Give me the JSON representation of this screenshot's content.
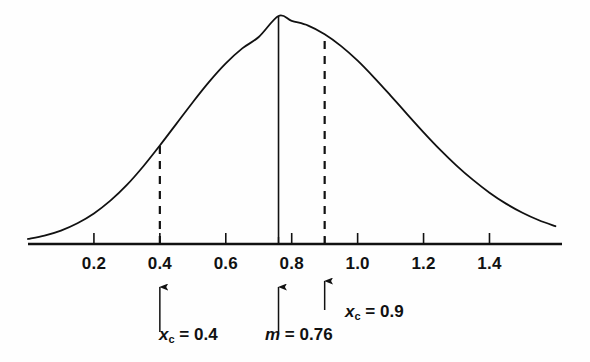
{
  "chart_data": {
    "type": "line",
    "title": "",
    "subtitle": "",
    "xlabel": "",
    "ylabel": "",
    "xlim": [
      0.0,
      1.62
    ],
    "ylim": [
      0.0,
      1.05
    ],
    "grid": false,
    "legend": false,
    "curve": {
      "name": "Gaussian distribution",
      "distribution": "normal",
      "mean": 0.76,
      "sigma": 0.31,
      "peak_value": 1.0
    },
    "x_tick_values": [
      0.2,
      0.4,
      0.6,
      0.8,
      1.0,
      1.2,
      1.4
    ],
    "x_tick_labels": [
      "0.2",
      "0.4",
      "0.6",
      "0.8",
      "1.0",
      "1.2",
      "1.4"
    ],
    "extra_ticks": [
      0.76,
      0.9
    ],
    "vertical_lines": [
      {
        "id": "xc-low",
        "x": 0.4,
        "style": "dashed",
        "label_text": "0.4"
      },
      {
        "id": "mean",
        "x": 0.76,
        "style": "solid",
        "label_text": "0.76"
      },
      {
        "id": "xc-high",
        "x": 0.9,
        "style": "dashed",
        "label_text": "0.9"
      }
    ],
    "annotations": [
      {
        "id": "ann-xc-low",
        "x": 0.4,
        "symbol": "x",
        "subscript": "c",
        "equals": "=",
        "value": "0.4"
      },
      {
        "id": "ann-mean",
        "x": 0.76,
        "symbol": "m",
        "subscript": "",
        "equals": "=",
        "value": "0.76"
      },
      {
        "id": "ann-xc-high",
        "x": 0.9,
        "symbol": "x",
        "subscript": "c",
        "equals": "=",
        "value": "0.9"
      }
    ],
    "series": [
      {
        "name": "Gaussian distribution",
        "x": [
          0.0,
          0.05,
          0.1,
          0.15,
          0.2,
          0.25,
          0.3,
          0.35,
          0.4,
          0.45,
          0.5,
          0.55,
          0.6,
          0.65,
          0.7,
          0.76,
          0.8,
          0.85,
          0.9,
          0.95,
          1.0,
          1.05,
          1.1,
          1.15,
          1.2,
          1.25,
          1.3,
          1.35,
          1.4,
          1.45,
          1.5,
          1.55,
          1.6
        ],
        "y": [
          0.022,
          0.037,
          0.059,
          0.091,
          0.134,
          0.19,
          0.259,
          0.341,
          0.432,
          0.527,
          0.622,
          0.712,
          0.792,
          0.858,
          0.908,
          1.0,
          0.979,
          0.958,
          0.92,
          0.868,
          0.804,
          0.73,
          0.651,
          0.57,
          0.49,
          0.414,
          0.344,
          0.281,
          0.225,
          0.177,
          0.137,
          0.104,
          0.078
        ]
      }
    ]
  },
  "axis": {
    "tick_labels": [
      {
        "text": "0.2",
        "x": 0.2
      },
      {
        "text": "0.4",
        "x": 0.4
      },
      {
        "text": "0.6",
        "x": 0.6
      },
      {
        "text": "0.8",
        "x": 0.8
      },
      {
        "text": "1.0",
        "x": 1.0
      },
      {
        "text": "1.2",
        "x": 1.2
      },
      {
        "text": "1.4",
        "x": 1.4
      }
    ]
  },
  "labels": {
    "xc_low": {
      "symbol": "x",
      "subscript": "c",
      "equals": "=",
      "value": "0.4"
    },
    "mean": {
      "symbol": "m",
      "subscript": "",
      "equals": "=",
      "value": "0.76"
    },
    "xc_high": {
      "symbol": "x",
      "subscript": "c",
      "equals": "=",
      "value": "0.9"
    }
  },
  "colors": {
    "ink": "#111111",
    "background": "#fefefe"
  }
}
